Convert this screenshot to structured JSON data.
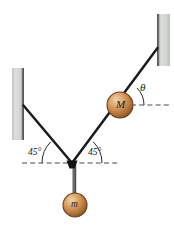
{
  "figure": {
    "kind": "physics-free-body-diagram",
    "background_color": "#ffffff",
    "width": 174,
    "height": 226
  },
  "labels": {
    "angle_left": "45°",
    "angle_right": "45°",
    "theta": "θ",
    "mass_big": "M",
    "mass_small": "m"
  },
  "colors": {
    "cable": "#1c1c1c",
    "wall_face": "#d3d6d2",
    "wall_edge": "#4f534f",
    "ball_light": "#e6bf8f",
    "ball_mid": "#c68b4e",
    "ball_dark": "#8a5421",
    "ball_outline": "#6b3f18",
    "dash": "#4a4a4a",
    "arc": "#2a2a2a",
    "rod": "#555555",
    "node": "#141414"
  },
  "geometry": {
    "junction": {
      "x": 72,
      "y": 163
    },
    "wall_right": {
      "x": 157,
      "y": 14,
      "w": 13,
      "h": 52,
      "anchor_x": 157,
      "anchor_y": 48
    },
    "wall_left": {
      "x": 12,
      "y": 68,
      "w": 12,
      "h": 72,
      "anchor_x": 24,
      "anchor_y": 105
    },
    "ball_M": {
      "cx": 120,
      "cy": 105,
      "r": 13
    },
    "ball_m": {
      "cx": 75,
      "cy": 205,
      "r": 12
    },
    "dash_junction": {
      "x1": 22,
      "x2": 120,
      "y": 163
    },
    "dash_M": {
      "x1": 131,
      "x2": 170,
      "y": 105
    },
    "arc_left_radius": 30,
    "arc_right_radius": 30,
    "arc_theta_radius": 24
  },
  "annotations": {
    "angle_left_value": 45,
    "angle_right_value": 45,
    "theta_name": "theta"
  }
}
